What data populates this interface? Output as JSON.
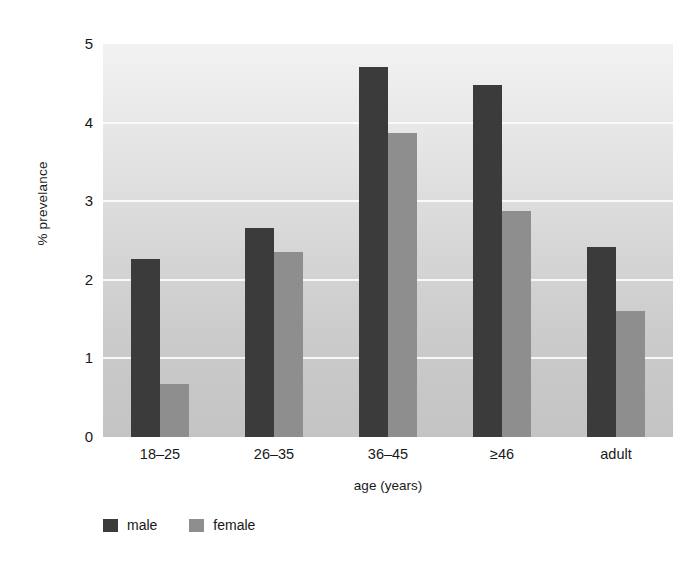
{
  "chart_data": {
    "type": "bar",
    "title": "",
    "subtitle": "",
    "xlabel": "age (years)",
    "ylabel": "% prevelance",
    "categories": [
      "18–25",
      "26–35",
      "36–45",
      "≥46",
      "adult"
    ],
    "series": [
      {
        "name": "male",
        "color": "#3b3b3b",
        "values": [
          2.26,
          2.66,
          4.71,
          4.48,
          2.42
        ]
      },
      {
        "name": "female",
        "color": "#8e8e8e",
        "values": [
          0.68,
          2.35,
          3.87,
          2.88,
          1.6
        ]
      }
    ],
    "ylim": [
      0,
      5
    ],
    "yticks": [
      0,
      1,
      2,
      3,
      4,
      5
    ],
    "ytick_labels": [
      "0",
      "1",
      "2",
      "3",
      "4",
      "5"
    ],
    "grid": true,
    "grid_axis": "y",
    "legend_position": "bottom-left",
    "annotations": []
  },
  "legend": {
    "entries": [
      {
        "label": "male",
        "color": "#3b3b3b"
      },
      {
        "label": "female",
        "color": "#8e8e8e"
      }
    ]
  },
  "colors": {
    "male": "#3b3b3b",
    "female": "#8e8e8e",
    "gridline": "#fbfbfb",
    "plot_background_top": "#f2f2f2",
    "plot_background_bottom": "#c4c4c4",
    "text": "#181818"
  }
}
